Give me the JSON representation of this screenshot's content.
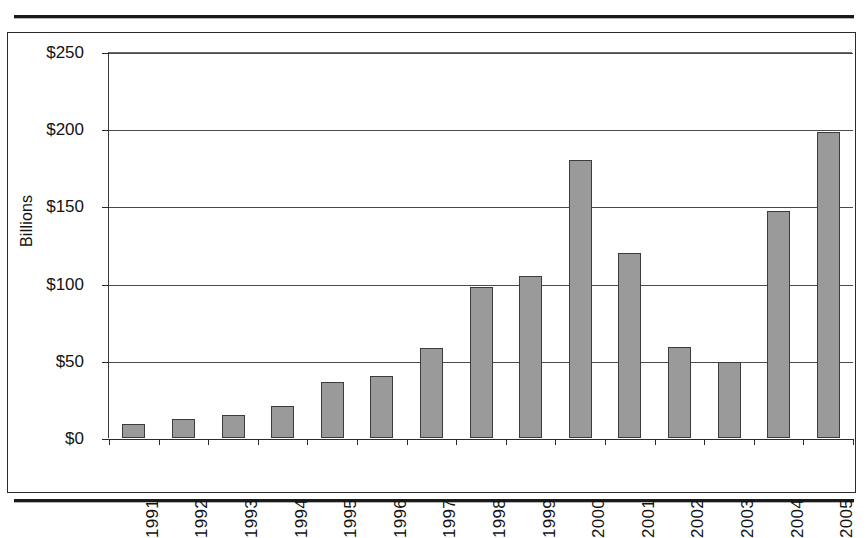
{
  "figure": {
    "cropped_caption": "",
    "axis_title": "Billions"
  },
  "chart_data": {
    "type": "bar",
    "title": "",
    "xlabel": "",
    "ylabel": "Billions",
    "categories": [
      "1991",
      "1992",
      "1993",
      "1994",
      "1995",
      "1996",
      "1997",
      "1998",
      "1999",
      "2000",
      "2001",
      "2002",
      "2003",
      "2004",
      "2005"
    ],
    "values": [
      9,
      12,
      15,
      21,
      36,
      40,
      58,
      98,
      105,
      180,
      120,
      59,
      49,
      147,
      198
    ],
    "ylim": [
      0,
      250
    ],
    "ytick_values": [
      0,
      50,
      100,
      150,
      200,
      250
    ],
    "ytick_labels": [
      "$0",
      "$50",
      "$100",
      "$150",
      "$200",
      "$250"
    ],
    "grid": true,
    "legend": "none",
    "bar_color": "#9a9a9a",
    "bar_edge_color": "#3c3c3c"
  }
}
